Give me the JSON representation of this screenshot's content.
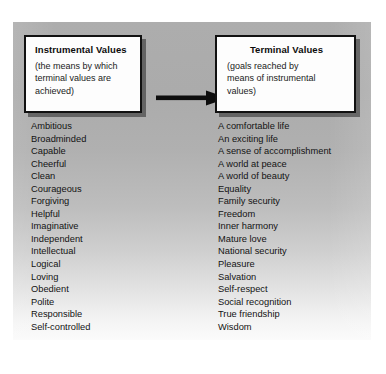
{
  "diagram": {
    "instrumental": {
      "title": "Instrumental Values",
      "subtitle": "(the means by which terminal values are achieved)",
      "subtitle_lines": [
        "(the means by which",
        "terminal values are",
        "achieved)"
      ],
      "items": [
        "Ambitious",
        "Broadminded",
        "Capable",
        "Cheerful",
        "Clean",
        "Courageous",
        "Forgiving",
        "Helpful",
        "Imaginative",
        "Independent",
        "Intellectual",
        "Logical",
        "Loving",
        "Obedient",
        "Polite",
        "Responsible",
        "Self-controlled"
      ]
    },
    "terminal": {
      "title": "Terminal Values",
      "subtitle": "(goals reached by means of instrumental values)",
      "subtitle_lines": [
        "(goals reached by",
        "means of instrumental",
        "values)"
      ],
      "items": [
        "A comfortable life",
        "An exciting life",
        "A sense of accomplishment",
        "A world at peace",
        "A world of beauty",
        "Equality",
        "Family security",
        "Freedom",
        "Inner harmony",
        "Mature love",
        "National security",
        "Pleasure",
        "Salvation",
        "Self-respect",
        "Social recognition",
        "True friendship",
        "Wisdom"
      ]
    },
    "connector": {
      "icon": "arrow-right-icon",
      "direction": "instrumental-to-terminal",
      "color": "#0d0d0d"
    },
    "colors": {
      "panel_top": "#adadad",
      "panel_bottom": "#fbfbfb",
      "box_fill": "#fdfdfd",
      "box_border": "#111111",
      "text": "#131313"
    }
  }
}
